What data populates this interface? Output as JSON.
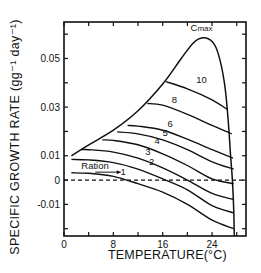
{
  "chart_data": {
    "type": "line",
    "title": "",
    "xlabel": "TEMPERATURE(°C)",
    "ylabel": "SPECIFIC GROWTH RATE (gg⁻¹ day⁻¹)",
    "xlim": [
      0,
      29.5
    ],
    "ylim": [
      -0.023,
      0.065
    ],
    "x_ticks": [
      0,
      4,
      8,
      12,
      16,
      20,
      24,
      28
    ],
    "x_tick_labels": [
      "0",
      "8",
      "16",
      "24"
    ],
    "x_tick_label_values": [
      0,
      8,
      16,
      24
    ],
    "y_ticks": [
      -0.02,
      -0.01,
      0,
      0.01,
      0.02,
      0.03,
      0.04,
      0.05,
      0.06
    ],
    "y_tick_labels": [
      "0.05",
      "0.03",
      "0.01",
      "0",
      "-0.01"
    ],
    "y_tick_label_values": [
      0.05,
      0.03,
      0.01,
      0,
      -0.01
    ],
    "grid": false,
    "reference_line": {
      "y": 0,
      "style": "dashed"
    },
    "annotation": {
      "text": "Ration",
      "arrow_to": "1"
    },
    "boundary": {
      "name": "Cmax",
      "x": [
        1.2,
        4,
        8,
        12,
        16,
        19,
        21,
        22.5,
        24,
        25,
        26,
        26.6,
        27,
        27.3,
        27.5,
        27.6
      ],
      "y": [
        0.01,
        0.0145,
        0.0205,
        0.0285,
        0.0395,
        0.05,
        0.0565,
        0.0585,
        0.057,
        0.052,
        0.04,
        0.025,
        0.01,
        0.0,
        -0.012,
        -0.023
      ]
    },
    "series": [
      {
        "name": "1",
        "x": [
          1.2,
          4,
          8,
          12,
          16,
          20,
          24,
          27.5
        ],
        "y": [
          0.003,
          0.0028,
          0.0015,
          -0.0015,
          -0.005,
          -0.01,
          -0.0165,
          -0.02
        ]
      },
      {
        "name": "2",
        "x": [
          1.2,
          4,
          8,
          12,
          16,
          20,
          24,
          27.5
        ],
        "y": [
          0.0085,
          0.0083,
          0.0072,
          0.0045,
          0.0005,
          -0.004,
          -0.0105,
          -0.0135
        ]
      },
      {
        "name": "3",
        "x": [
          2.8,
          4,
          8,
          12,
          16,
          20,
          24,
          27.5
        ],
        "y": [
          0.0125,
          0.0125,
          0.0115,
          0.009,
          0.005,
          0.0,
          -0.0055,
          -0.008
        ]
      },
      {
        "name": "4",
        "x": [
          6.2,
          8,
          12,
          16,
          20,
          24,
          27.5
        ],
        "y": [
          0.0165,
          0.0163,
          0.0145,
          0.0108,
          0.006,
          0.0005,
          -0.0015
        ]
      },
      {
        "name": "5",
        "x": [
          8.6,
          12,
          16,
          20,
          24,
          27.5
        ],
        "y": [
          0.0198,
          0.019,
          0.0165,
          0.0125,
          0.0075,
          0.0045
        ]
      },
      {
        "name": "6",
        "x": [
          10.3,
          12,
          16,
          20,
          24,
          27.4
        ],
        "y": [
          0.0225,
          0.0222,
          0.0205,
          0.0168,
          0.0125,
          0.009
        ]
      },
      {
        "name": "8",
        "x": [
          13.5,
          16,
          20,
          24,
          27.2
        ],
        "y": [
          0.0315,
          0.0308,
          0.027,
          0.0225,
          0.019
        ]
      },
      {
        "name": "10",
        "x": [
          16.5,
          20,
          24,
          26.5
        ],
        "y": [
          0.0405,
          0.0375,
          0.033,
          0.029
        ]
      }
    ],
    "curve_label_positions": [
      {
        "label": "1",
        "x": 9.6,
        "y": 0.002
      },
      {
        "label": "2",
        "x": 14.2,
        "y": 0.006
      },
      {
        "label": "3",
        "x": 13.6,
        "y": 0.0105
      },
      {
        "label": "4",
        "x": 15.1,
        "y": 0.015
      },
      {
        "label": "5",
        "x": 16.4,
        "y": 0.0183
      },
      {
        "label": "6",
        "x": 17.2,
        "y": 0.022
      },
      {
        "label": "8",
        "x": 17.9,
        "y": 0.0315
      },
      {
        "label": "10",
        "x": 22.3,
        "y": 0.04
      },
      {
        "label": "Cmax",
        "x": 22.3,
        "y": 0.0615
      }
    ]
  }
}
